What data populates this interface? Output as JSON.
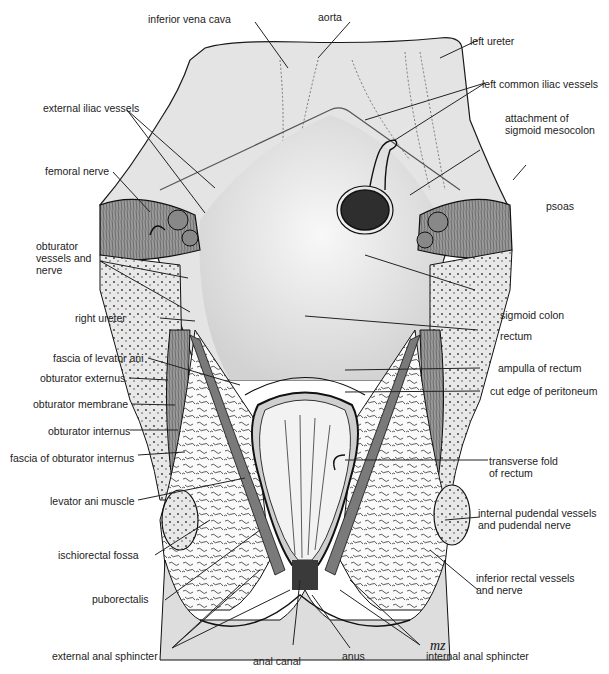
{
  "figure": {
    "signature": "mz"
  },
  "labels": {
    "inferior_vena_cava": "inferior vena cava",
    "aorta": "aorta",
    "left_ureter": "left ureter",
    "left_common_iliac_vessels": "left common iliac vessels",
    "external_iliac_vessels": "external iliac vessels",
    "attachment_sigmoid_mesocolon": "attachment of\nsigmoid mesocolon",
    "femoral_nerve": "femoral nerve",
    "psoas": "psoas",
    "obturator_vessels_nerve": "obturator\nvessels and\nnerve",
    "sigmoid_colon": "sigmoid colon",
    "right_ureter": "right ureter",
    "rectum": "rectum",
    "fascia_levator_ani": "fascia of levator ani",
    "ampulla_rectum": "ampulla of rectum",
    "obturator_externus": "obturator externus",
    "cut_edge_peritoneum": "cut edge of peritoneum",
    "obturator_membrane": "obturator membrane",
    "obturator_internus": "obturator internus",
    "fascia_obturator_internus": "fascia of obturator internus",
    "transverse_fold_rectum": "transverse fold\nof rectum",
    "levator_ani_muscle": "levator ani muscle",
    "internal_pudendal": "internal pudendal vessels\nand pudendal nerve",
    "ischiorectal_fossa": "ischiorectal fossa",
    "inferior_rectal": "inferior rectal vessels\nand nerve",
    "puborectalis": "puborectalis",
    "external_anal_sphincter": "external anal sphincter",
    "anal_canal": "anal canal",
    "anus": "anus",
    "internal_anal_sphincter": "internal anal sphincter"
  },
  "colors": {
    "background": "#ffffff",
    "peritoneum_fill": "#e4e4e4",
    "tissue_fill": "#f4f4f4",
    "muscle_fill": "#8a8a8a",
    "fat_fill": "#fafafa",
    "outline": "#1a1a1a",
    "leader": "#222222"
  }
}
